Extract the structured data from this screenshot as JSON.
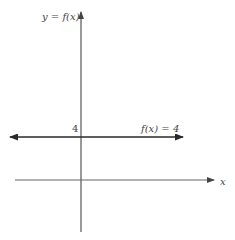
{
  "diagram": {
    "y_axis": {
      "label_lhs": "y",
      "label_eq": " = ",
      "label_rhs": "f(x)",
      "label": "y = f(x)"
    },
    "x_axis": {
      "label": "x"
    },
    "tick_labels": {
      "y_value": "4"
    },
    "function_line": {
      "label": "f(x) = 4",
      "value": 4,
      "color": "#333333"
    },
    "colors": {
      "axis": "#555555",
      "line": "#2a2a2a",
      "text": "#444444",
      "background": "#ffffff"
    }
  }
}
